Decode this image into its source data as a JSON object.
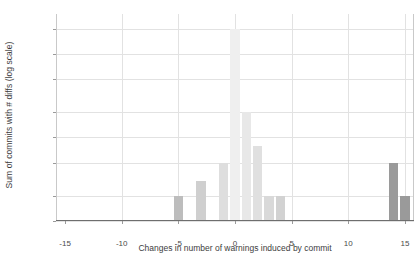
{
  "chart_data": {
    "type": "bar",
    "title": "",
    "xlabel": "Changes in number of warnings induced by commit",
    "ylabel": "Sum of commits with # diffs (log scale)",
    "yscale": "log",
    "ylim": [
      1,
      300
    ],
    "xlim": [
      -15.8,
      15.8
    ],
    "grid": true,
    "legend": null,
    "y_ticks": [
      {
        "value": 200,
        "label": "2"
      },
      {
        "value": 100,
        "label": "100"
      },
      {
        "value": 50,
        "label": "5"
      },
      {
        "value": 20,
        "label": "2"
      },
      {
        "value": 10,
        "label": "10"
      },
      {
        "value": 5,
        "label": "5"
      },
      {
        "value": 2,
        "label": "2"
      },
      {
        "value": 1,
        "label": "1"
      }
    ],
    "x_ticks": [
      {
        "value": -15,
        "label": "-15"
      },
      {
        "value": -10,
        "label": "-10"
      },
      {
        "value": -5,
        "label": "-5"
      },
      {
        "value": 0,
        "label": "0"
      },
      {
        "value": 5,
        "label": "5"
      },
      {
        "value": 10,
        "label": "10"
      },
      {
        "value": 15,
        "label": "15"
      }
    ],
    "x_gridlines": [
      -10,
      -5,
      0,
      5,
      10,
      15
    ],
    "bar_width": 0.82,
    "categories": [
      -15,
      -14,
      -10,
      -5,
      -4,
      -3,
      -2,
      -1,
      0,
      1,
      2,
      3,
      4,
      6,
      8,
      10,
      14,
      15
    ],
    "values": [
      1,
      1,
      1,
      2,
      1,
      3,
      1,
      5,
      200,
      20,
      8,
      2,
      2,
      1,
      1,
      1,
      5,
      2
    ],
    "bar_colors": [
      "#8d8d8d",
      "#8d8d8d",
      "#9e9e9e",
      "#bdbdbd",
      "#c6c6c6",
      "#cfcfcf",
      "#d5d5d5",
      "#dedede",
      "#efefef",
      "#e8e8e8",
      "#e0e0e0",
      "#d9d9d9",
      "#d2d2d2",
      "#cacaca",
      "#c2c2c2",
      "#b8b8b8",
      "#9a9a9a",
      "#9a9a9a"
    ]
  },
  "axes": {
    "grid_color": "#e2e2e2",
    "frame_color": "#c9c9c9",
    "axis_color": "#6e6e6e",
    "text_color": "#3d3d3d"
  }
}
